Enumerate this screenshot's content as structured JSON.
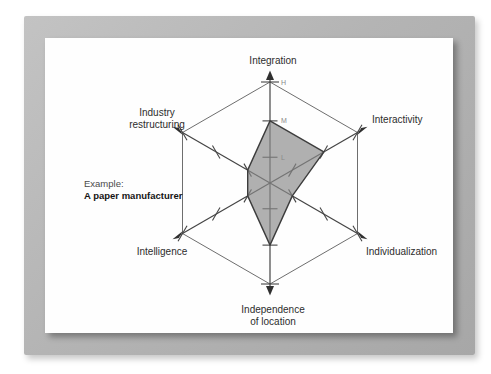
{
  "chart_data": {
    "type": "radar",
    "title": "",
    "axes": [
      {
        "label": "Integration",
        "label_lines": [
          "Integration"
        ],
        "value": "M"
      },
      {
        "label": "Interactivity",
        "label_lines": [
          "Interactivity"
        ],
        "value": "M"
      },
      {
        "label": "Individualization",
        "label_lines": [
          "Individualization"
        ],
        "value": "L"
      },
      {
        "label": "Independence of location",
        "label_lines": [
          "Independence",
          "of location"
        ],
        "value": "M"
      },
      {
        "label": "Intelligence",
        "label_lines": [
          "Intelligence"
        ],
        "value": "L"
      },
      {
        "label": "Industry restructuring",
        "label_lines": [
          "Industry",
          "restructuring"
        ],
        "value": "L"
      }
    ],
    "series": [
      {
        "name": "A paper manufacturer",
        "values": [
          "M",
          "M",
          "L",
          "M",
          "L",
          "L"
        ]
      }
    ],
    "scale": {
      "tick_labels": [
        "L",
        "M",
        "H"
      ],
      "tick_fractions": {
        "L": 0.255,
        "M": 0.615,
        "H": 1.0
      },
      "tick_labels_shown_on_axis": "Integration"
    },
    "annotation": {
      "line1": "Example:",
      "line2": "A paper manufacturer"
    },
    "grid": "hexagon-outline",
    "legend_position": "none",
    "colors": {
      "axis_line": "#444444",
      "grid_line": "#6e6e6e",
      "polygon_fill": "#8a8a8a",
      "polygon_stroke": "#3d3d3d",
      "axis_label": "#2d2d2d",
      "tick_label": "#8a8a8a",
      "frame_gray": "#b4b4b4",
      "page_white": "#fefefe"
    }
  }
}
